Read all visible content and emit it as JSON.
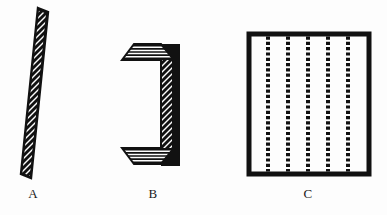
{
  "figure": {
    "background_color": "#fdfdfd",
    "ink_color": "#111111",
    "caption_font_size_px": 13,
    "panels": [
      {
        "id": "A",
        "label": "A",
        "name": "flat-hatched-plate",
        "description": "Tall narrow parallelogram plate rendered in oblique view with dense diagonal hatching running from lower-left to upper-right",
        "label_x": 33,
        "label_y": 190,
        "outline_points": "38,8 48,12 31,178 21,174",
        "hatch": {
          "direction": "diagonal-up-right",
          "angle_deg": 45,
          "spacing_px": 3.1,
          "stroke_width_px": 1.5
        },
        "bounds": {
          "x": 21,
          "y": 8,
          "w": 27,
          "h": 170
        }
      },
      {
        "id": "B",
        "label": "B",
        "name": "c-channel-bracket",
        "description": "C-shaped channel section drawn in oblique projection; top and bottom flanges carry horizontal hatching, the vertical web carries diagonal hatching, and the far side faces are solid black",
        "label_x": 152,
        "label_y": 190,
        "bounds": {
          "x": 120,
          "y": 42,
          "w": 56,
          "h": 124
        },
        "parts": [
          {
            "name": "top-flange",
            "fill": "horizontal-hatch"
          },
          {
            "name": "top-flange-edge",
            "fill": "solid-black"
          },
          {
            "name": "web-face",
            "fill": "diagonal-hatch"
          },
          {
            "name": "web-side",
            "fill": "solid-black"
          },
          {
            "name": "bottom-flange",
            "fill": "horizontal-hatch"
          },
          {
            "name": "bottom-flange-edge",
            "fill": "solid-black"
          }
        ]
      },
      {
        "id": "C",
        "label": "C",
        "name": "slotted-panel-frame",
        "description": "Square frame with thick solid black border enclosing five evenly spaced vertical dotted slot lines",
        "label_x": 307,
        "label_y": 190,
        "bounds": {
          "x": 249,
          "y": 34,
          "w": 120,
          "h": 140
        },
        "border_width_px": 5,
        "slot_count": 5,
        "slot_x_positions": [
          268,
          288,
          308,
          328,
          348
        ],
        "slot_dash_length_px": 3.2,
        "slot_gap_px": 2.1,
        "slot_width_px": 4
      }
    ]
  }
}
